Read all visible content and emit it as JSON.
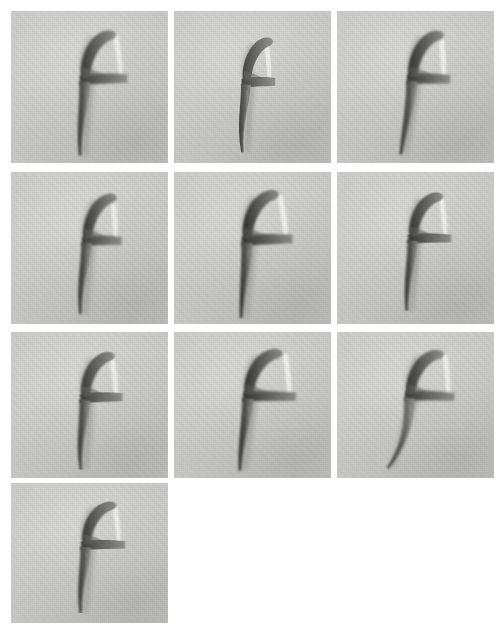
{
  "page": {
    "background_color": "#ffffff",
    "width": 504,
    "height": 633,
    "item_count": 10,
    "columns": 3,
    "rows": 4,
    "note": "Grid of 10 grayscale photographs of a dental floss pick on a flat grey backdrop; the tenth tile occupies the bottom-left cell and the last two cells are empty."
  },
  "palette": {
    "page_bg": "#ffffff",
    "tile_bg": "#cbcbc9",
    "tile_bg_light": "#d6d6d3",
    "tile_bg_dark": "#bdbdba",
    "object_dark": "#2b2b2b",
    "object_mid": "#5a5a58",
    "object_soft": "#8a8a88",
    "floss_white": "#f4f3ee",
    "floss_shadow": "#b9b9b5"
  },
  "grid": {
    "tile_width": 157,
    "tile_height": 152,
    "col_x": [
      11,
      174,
      337
    ],
    "row_y": [
      11,
      172,
      332,
      483
    ],
    "row_heights": [
      152,
      152,
      146,
      140
    ]
  },
  "tiles": [
    {
      "id": "tile-1",
      "label": "Floss pick 1",
      "row": 1,
      "col": 1,
      "x": 11,
      "y": 11,
      "w": 157,
      "h": 152,
      "rotate": -1.0,
      "scale": 1.0,
      "ox": 0,
      "oy": 0,
      "handle_bend": 0.1,
      "head_scale": 1.06,
      "contrast": 1.0
    },
    {
      "id": "tile-2",
      "label": "Floss pick 2",
      "row": 1,
      "col": 2,
      "x": 174,
      "y": 11,
      "w": 157,
      "h": 152,
      "rotate": 0.0,
      "scale": 0.92,
      "ox": -3,
      "oy": 4,
      "handle_bend": 0.02,
      "head_scale": 0.96,
      "contrast": 0.94
    },
    {
      "id": "tile-3",
      "label": "Floss pick 3",
      "row": 1,
      "col": 3,
      "x": 337,
      "y": 11,
      "w": 157,
      "h": 152,
      "rotate": 1.5,
      "scale": 1.0,
      "ox": 1,
      "oy": -1,
      "handle_bend": 0.22,
      "head_scale": 1.02,
      "contrast": 1.05
    },
    {
      "id": "tile-4",
      "label": "Floss pick 4",
      "row": 2,
      "col": 1,
      "x": 11,
      "y": 172,
      "w": 157,
      "h": 152,
      "rotate": 1.0,
      "scale": 0.97,
      "ox": 2,
      "oy": 0,
      "handle_bend": 0.06,
      "head_scale": 1.0,
      "contrast": 1.02
    },
    {
      "id": "tile-5",
      "label": "Floss pick 5",
      "row": 2,
      "col": 2,
      "x": 174,
      "y": 172,
      "w": 157,
      "h": 152,
      "rotate": -1.5,
      "scale": 1.02,
      "ox": -1,
      "oy": 0,
      "handle_bend": 0.16,
      "head_scale": 1.08,
      "contrast": 1.08
    },
    {
      "id": "tile-6",
      "label": "Floss pick 6",
      "row": 2,
      "col": 3,
      "x": 337,
      "y": 172,
      "w": 157,
      "h": 152,
      "rotate": 0.5,
      "scale": 0.95,
      "ox": 2,
      "oy": -4,
      "handle_bend": 0.08,
      "head_scale": 1.04,
      "contrast": 1.04
    },
    {
      "id": "tile-7",
      "label": "Floss pick 7",
      "row": 3,
      "col": 1,
      "x": 11,
      "y": 332,
      "w": 157,
      "h": 146,
      "rotate": -0.5,
      "scale": 0.98,
      "ox": 0,
      "oy": 0,
      "handle_bend": 0.05,
      "head_scale": 1.02,
      "contrast": 1.0
    },
    {
      "id": "tile-8",
      "label": "Floss pick 8",
      "row": 3,
      "col": 2,
      "x": 174,
      "y": 332,
      "w": 157,
      "h": 146,
      "rotate": 1.0,
      "scale": 1.02,
      "ox": 0,
      "oy": -2,
      "handle_bend": 0.12,
      "head_scale": 1.1,
      "contrast": 1.06
    },
    {
      "id": "tile-9",
      "label": "Floss pick 9",
      "row": 3,
      "col": 3,
      "x": 337,
      "y": 332,
      "w": 157,
      "h": 146,
      "rotate": 2.0,
      "scale": 1.0,
      "ox": -2,
      "oy": -3,
      "handle_bend": 0.62,
      "head_scale": 1.08,
      "contrast": 1.02
    },
    {
      "id": "tile-10",
      "label": "Floss pick 10",
      "row": 4,
      "col": 1,
      "x": 11,
      "y": 483,
      "w": 157,
      "h": 140,
      "rotate": 0.0,
      "scale": 0.97,
      "ox": 1,
      "oy": -2,
      "handle_bend": 0.07,
      "head_scale": 1.04,
      "contrast": 1.0
    }
  ]
}
